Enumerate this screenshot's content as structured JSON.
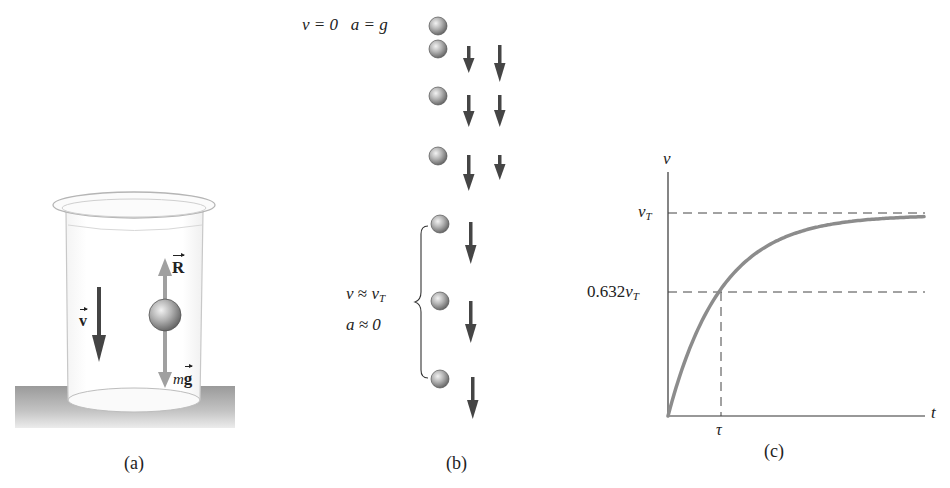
{
  "panel_a": {
    "caption": "(a)",
    "velocity_label": "v",
    "resistive_force_label": "R",
    "gravity_label_prefix": "m",
    "gravity_label_vector": "g"
  },
  "panel_b": {
    "caption": "(b)",
    "top_label": "v = 0   a = g",
    "bracket_label_line1_v": "v",
    "bracket_label_line1_rel": " ≈ ",
    "bracket_label_line1_vt": "v",
    "bracket_label_line1_sub": "T",
    "bracket_label_line2": "a ≈ 0",
    "column_headers": [
      "velocity",
      "acceleration"
    ]
  },
  "panel_c": {
    "caption": "(c)",
    "y_axis_label": "v",
    "x_axis_label": "t",
    "vt_label_main": "v",
    "vt_label_sub": "T",
    "frac_label_coef": "0.632",
    "frac_label_main": "v",
    "frac_label_sub": "T",
    "tau_label": "τ"
  },
  "colors": {
    "curve": "#8c8c8c",
    "arrow_dark": "#444444",
    "arrow_light": "#a0a0a0",
    "table_surface": "#b4b4b4",
    "axis": "#333333",
    "dashed": "#444444"
  },
  "chart_data": {
    "type": "line",
    "title": "",
    "xlabel": "t",
    "ylabel": "v",
    "function": "v(t) = v_T (1 - e^{-t/τ})",
    "x": [
      0,
      0.5,
      1,
      1.5,
      2,
      2.5,
      3,
      3.5,
      4,
      4.5,
      5
    ],
    "series": [
      {
        "name": "v(t)/v_T",
        "values": [
          0,
          0.393,
          0.632,
          0.777,
          0.865,
          0.918,
          0.95,
          0.97,
          0.982,
          0.989,
          0.993
        ]
      }
    ],
    "x_ticks": [
      {
        "value": 1,
        "label": "τ"
      }
    ],
    "y_ticks": [
      {
        "value": 0.632,
        "label": "0.632v_T"
      },
      {
        "value": 1.0,
        "label": "v_T"
      }
    ],
    "reference_lines": [
      {
        "type": "horizontal",
        "y": 1.0,
        "style": "dashed",
        "label": "v_T"
      },
      {
        "type": "horizontal",
        "y": 0.632,
        "style": "dashed",
        "label": "0.632v_T"
      },
      {
        "type": "vertical",
        "x": 1,
        "style": "dashed",
        "label": "τ"
      }
    ],
    "xlim": [
      0,
      5
    ],
    "ylim": [
      0,
      1.25
    ],
    "grid": false,
    "legend": "none"
  }
}
